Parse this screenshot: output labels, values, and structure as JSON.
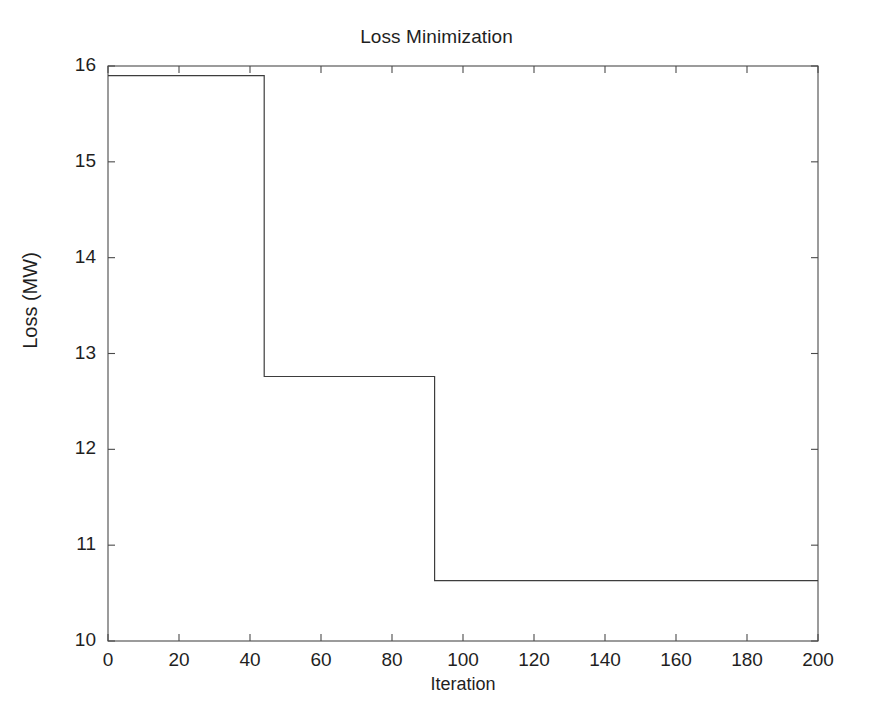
{
  "chart_data": {
    "type": "line",
    "title": "Loss Minimization",
    "xlabel": "Iteration",
    "ylabel": "Loss (MW)",
    "xlim": [
      0,
      200
    ],
    "ylim": [
      10,
      16
    ],
    "xticks": [
      0,
      20,
      40,
      60,
      80,
      100,
      120,
      140,
      160,
      180,
      200
    ],
    "yticks": [
      10,
      11,
      12,
      13,
      14,
      15,
      16
    ],
    "xtick_labels": [
      "0",
      "20",
      "40",
      "60",
      "80",
      "100",
      "120",
      "140",
      "160",
      "180",
      "200"
    ],
    "ytick_labels": [
      "10",
      "11",
      "12",
      "13",
      "14",
      "15",
      "16"
    ],
    "grid": false,
    "legend": false,
    "line_style": "step-post",
    "line_color": "#3d3d3d",
    "line_width": 1,
    "background_color": "#ffffff",
    "axis_color": "#4a4a4a",
    "series": [
      {
        "name": "Loss",
        "x": [
          0,
          44,
          44,
          92,
          92,
          200
        ],
        "values": [
          15.9,
          15.9,
          12.76,
          12.76,
          10.63,
          10.63
        ]
      }
    ],
    "steps": [
      {
        "from_iteration": 0,
        "to_iteration": 44,
        "loss": 15.9
      },
      {
        "from_iteration": 44,
        "to_iteration": 92,
        "loss": 12.76
      },
      {
        "from_iteration": 92,
        "to_iteration": 200,
        "loss": 10.63
      }
    ],
    "annotations": []
  }
}
